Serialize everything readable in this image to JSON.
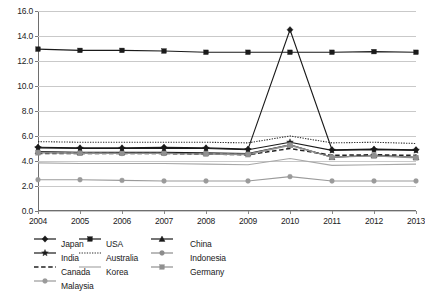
{
  "title": "",
  "chart_data": {
    "type": "line",
    "title": "",
    "xlabel": "",
    "ylabel": "",
    "categories": [
      "2004",
      "2005",
      "2006",
      "2007",
      "2008",
      "2009",
      "2010",
      "2011",
      "2012",
      "2013"
    ],
    "ylim": [
      0.0,
      16.0
    ],
    "ytick_step": 2.0,
    "yticks": [
      "0.0",
      "2.0",
      "4.0",
      "6.0",
      "8.0",
      "10.0",
      "12.0",
      "14.0",
      "16.0"
    ],
    "grid": true,
    "legend_position": "bottom",
    "series": [
      {
        "name": "Japan",
        "marker": "diamond",
        "line": "solid",
        "color": "#1a1a1a",
        "values": [
          5.1,
          5.05,
          5.05,
          5.1,
          5.05,
          4.95,
          14.5,
          4.9,
          4.95,
          4.9
        ]
      },
      {
        "name": "USA",
        "marker": "square",
        "line": "solid",
        "color": "#1a1a1a",
        "values": [
          12.95,
          12.85,
          12.85,
          12.8,
          12.7,
          12.7,
          12.7,
          12.7,
          12.75,
          12.7
        ]
      },
      {
        "name": "China",
        "marker": "triangle",
        "line": "solid",
        "color": "#1a1a1a",
        "values": [
          4.75,
          4.7,
          4.7,
          4.7,
          4.65,
          4.6,
          5.3,
          4.3,
          4.45,
          4.3
        ]
      },
      {
        "name": "India",
        "marker": "star",
        "line": "solid",
        "color": "#1a1a1a",
        "values": [
          5.05,
          5.0,
          5.0,
          5.0,
          5.0,
          4.9,
          5.5,
          4.85,
          4.9,
          4.85
        ]
      },
      {
        "name": "Australia",
        "marker": "none",
        "line": "dotted",
        "color": "#2b2b2b",
        "values": [
          5.55,
          5.5,
          5.5,
          5.5,
          5.5,
          5.45,
          6.0,
          5.45,
          5.5,
          5.4
        ]
      },
      {
        "name": "Indonesia",
        "marker": "circle",
        "line": "solid",
        "color": "#8c8c8c",
        "values": [
          4.7,
          4.65,
          4.6,
          4.6,
          4.6,
          4.55,
          5.3,
          4.3,
          4.45,
          4.3
        ]
      },
      {
        "name": "Canada",
        "marker": "none",
        "line": "dashed",
        "color": "#222222",
        "values": [
          4.6,
          4.6,
          4.6,
          4.6,
          4.55,
          4.5,
          5.0,
          4.45,
          4.5,
          4.45
        ]
      },
      {
        "name": "Korea",
        "marker": "none",
        "line": "solid",
        "color": "#a8a8a8",
        "values": [
          3.85,
          3.8,
          3.8,
          3.8,
          3.75,
          3.7,
          4.2,
          3.65,
          3.7,
          3.75
        ]
      },
      {
        "name": "Germany",
        "marker": "square",
        "line": "solid",
        "color": "#909090",
        "values": [
          4.65,
          4.6,
          4.6,
          4.6,
          4.55,
          4.5,
          5.25,
          4.3,
          4.4,
          4.25
        ]
      },
      {
        "name": "Malaysia",
        "marker": "circle",
        "line": "solid",
        "color": "#9a9a9a",
        "values": [
          2.5,
          2.5,
          2.45,
          2.4,
          2.4,
          2.4,
          2.75,
          2.4,
          2.4,
          2.4
        ]
      }
    ]
  },
  "legend": {
    "items": [
      {
        "label": "Japan",
        "col": 0,
        "row": 0
      },
      {
        "label": "USA",
        "col": 1,
        "row": 0
      },
      {
        "label": "China",
        "col": 2,
        "row": 0
      },
      {
        "label": "India",
        "col": 0,
        "row": 1
      },
      {
        "label": "Australia",
        "col": 1,
        "row": 1
      },
      {
        "label": "Indonesia",
        "col": 2,
        "row": 1
      },
      {
        "label": "Canada",
        "col": 0,
        "row": 2
      },
      {
        "label": "Korea",
        "col": 1,
        "row": 2
      },
      {
        "label": "Germany",
        "col": 2,
        "row": 2
      },
      {
        "label": "Malaysia",
        "col": 0,
        "row": 3
      }
    ]
  }
}
